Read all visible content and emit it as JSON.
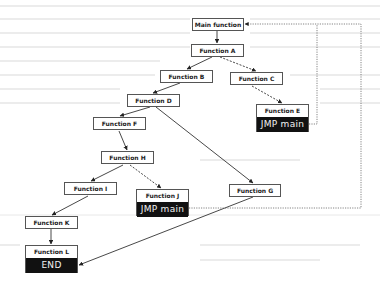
{
  "diagram": {
    "type": "call-flow",
    "nodes": [
      {
        "id": "main",
        "label": "Main function"
      },
      {
        "id": "A",
        "label": "Function A"
      },
      {
        "id": "B",
        "label": "Function B"
      },
      {
        "id": "C",
        "label": "Function C"
      },
      {
        "id": "D",
        "label": "Function D"
      },
      {
        "id": "E",
        "label": "Function E",
        "sub": "JMP main"
      },
      {
        "id": "F",
        "label": "Function F"
      },
      {
        "id": "G",
        "label": "Function G"
      },
      {
        "id": "H",
        "label": "Function H"
      },
      {
        "id": "I",
        "label": "Function I"
      },
      {
        "id": "J",
        "label": "Function J",
        "sub": "JMP main"
      },
      {
        "id": "K",
        "label": "Function K"
      },
      {
        "id": "L",
        "label": "Function L",
        "sub": "END"
      }
    ],
    "edges": [
      {
        "from": "main",
        "to": "A",
        "style": "solid"
      },
      {
        "from": "A",
        "to": "B",
        "style": "solid"
      },
      {
        "from": "A",
        "to": "C",
        "style": "dashed"
      },
      {
        "from": "B",
        "to": "D",
        "style": "solid"
      },
      {
        "from": "C",
        "to": "E",
        "style": "dashed"
      },
      {
        "from": "D",
        "to": "F",
        "style": "solid"
      },
      {
        "from": "D",
        "to": "G",
        "style": "solid"
      },
      {
        "from": "F",
        "to": "H",
        "style": "solid"
      },
      {
        "from": "H",
        "to": "I",
        "style": "solid"
      },
      {
        "from": "H",
        "to": "J",
        "style": "dashed"
      },
      {
        "from": "I",
        "to": "K",
        "style": "solid"
      },
      {
        "from": "K",
        "to": "L",
        "style": "solid"
      },
      {
        "from": "G",
        "to": "L",
        "style": "solid"
      },
      {
        "from": "E",
        "to": "main",
        "style": "dotted"
      },
      {
        "from": "J",
        "to": "main",
        "style": "dotted"
      }
    ]
  }
}
